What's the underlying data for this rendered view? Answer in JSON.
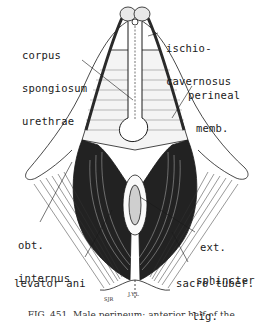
{
  "figure": {
    "type": "anatomical line drawing",
    "subject": "male perineum",
    "labels": {
      "corpus_spongiosum": [
        "corpus",
        "spongiosum",
        "urethrae"
      ],
      "ischiocavernosus": [
        "ischio-",
        "cavernosus"
      ],
      "perineal_membrane": [
        "perineal",
        "memb."
      ],
      "obturator_internus": [
        "obt.",
        "internus"
      ],
      "ext_sphincter": [
        "ext.",
        "sphincter"
      ],
      "levator_ani": "levator ani",
      "sacrotuberous_lig": [
        "sacro-tuber.",
        "lig."
      ]
    },
    "artist_signature": "SJR",
    "small_mark": "J.Y.L",
    "caption": "FIG. 451. Male perineum; anterior half of the..."
  },
  "colors": {
    "ink": "#1a1a1a",
    "background": "#ffffff"
  }
}
